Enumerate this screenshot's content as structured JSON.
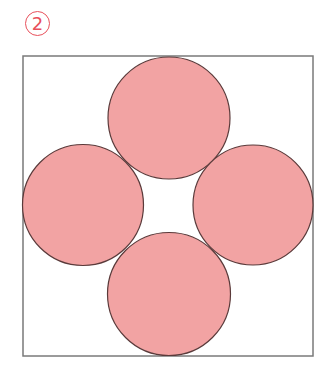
{
  "figure": {
    "label": "2",
    "label_color": "#E8505B"
  },
  "diagram": {
    "frame": {
      "x": 23,
      "y": 56,
      "width": 290,
      "height": 300,
      "stroke": "#7a7a7a"
    },
    "circle_fill": "#F2A3A3",
    "circle_stroke": "#5a3a3a",
    "circles": [
      {
        "name": "top",
        "cx": 169,
        "cy": 118,
        "r": 61
      },
      {
        "name": "left",
        "cx": 83,
        "cy": 205,
        "r": 60.5
      },
      {
        "name": "right",
        "cx": 253,
        "cy": 205,
        "r": 60
      },
      {
        "name": "bottom",
        "cx": 169,
        "cy": 294,
        "r": 61.5
      }
    ]
  }
}
